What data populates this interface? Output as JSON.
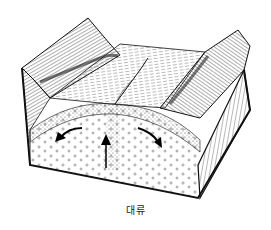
{
  "figure": {
    "caption": "대류",
    "elements": {
      "left_ridge": "left-mountain-ridge",
      "right_ridge": "right-mountain-ridge",
      "valley_floor": "rift-valley-floor",
      "rift_crack": "central-rift-fissure",
      "crust_layer": "crust-layer",
      "mantle": "mantle-section",
      "arrows": [
        "upwelling-arrow",
        "left-flow-arrow",
        "right-flow-arrow"
      ]
    },
    "colors": {
      "ink": "#111111",
      "paper": "#ffffff",
      "shade": "#555555"
    }
  }
}
